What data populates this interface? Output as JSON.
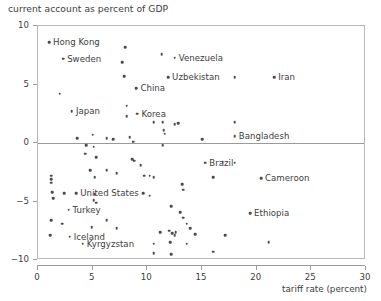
{
  "chart_data": {
    "type": "scatter",
    "title": "current account as percent of GDP",
    "xlabel": "tariff rate (percent)",
    "ylabel": "current account as percent of GDP",
    "xlim": [
      0,
      30
    ],
    "ylim": [
      -10,
      10
    ],
    "xticks": [
      0,
      5,
      10,
      15,
      20,
      25,
      30
    ],
    "yticks": [
      -10,
      -5,
      0,
      5,
      10
    ],
    "xtick_labels": [
      "0",
      "5",
      "10",
      "15",
      "20",
      "25",
      "30"
    ],
    "ytick_labels": [
      "−10",
      "−5",
      "0",
      "5",
      "10"
    ],
    "grid": false,
    "legend": null,
    "reference_lines": [
      {
        "axis": "y",
        "value": 0
      }
    ],
    "marker_color": "#4a4a4a",
    "axis_color": "#9a9a9a",
    "labeled_points": [
      {
        "label": "Hong Kong",
        "x": 1.0,
        "y": 8.6,
        "label_dx": 4
      },
      {
        "label": "Sweden",
        "x": 2.3,
        "y": 7.2,
        "label_dx": 4
      },
      {
        "label": "Venezuela",
        "x": 12.5,
        "y": 7.3,
        "label_dx": 4
      },
      {
        "label": "Uzbekistan",
        "x": 11.9,
        "y": 5.6,
        "label_dx": 4
      },
      {
        "label": "Iran",
        "x": 21.6,
        "y": 5.6,
        "label_dx": 4
      },
      {
        "label": "China",
        "x": 9.0,
        "y": 4.7,
        "label_dx": 4
      },
      {
        "label": "Japan",
        "x": 3.1,
        "y": 2.7,
        "label_dx": 4
      },
      {
        "label": "Korea",
        "x": 9.1,
        "y": 2.5,
        "label_dx": 4
      },
      {
        "label": "Bangladesh",
        "x": 18.0,
        "y": 0.6,
        "label_dx": 4
      },
      {
        "label": "Brazil",
        "x": 15.3,
        "y": -1.7,
        "label_dx": 4
      },
      {
        "label": "Cameroon",
        "x": 20.4,
        "y": -3.0,
        "label_dx": 4
      },
      {
        "label": "United States",
        "x": 3.5,
        "y": -4.3,
        "label_dx": 4
      },
      {
        "label": "Turkey",
        "x": 2.8,
        "y": -5.7,
        "label_dx": 4
      },
      {
        "label": "Ethiopia",
        "x": 19.4,
        "y": -6.0,
        "label_dx": 4
      },
      {
        "label": "Iceland",
        "x": 2.9,
        "y": -8.0,
        "label_dx": 4
      },
      {
        "label": "Kyrgyzstan",
        "x": 4.1,
        "y": -8.6,
        "label_dx": 4
      }
    ],
    "unlabeled_points": [
      {
        "x": 8.0,
        "y": 8.2
      },
      {
        "x": 11.3,
        "y": 7.6
      },
      {
        "x": 7.7,
        "y": 6.9
      },
      {
        "x": 7.9,
        "y": 5.7
      },
      {
        "x": 18.0,
        "y": 5.6
      },
      {
        "x": 2.0,
        "y": 4.2
      },
      {
        "x": 8.1,
        "y": 3.2
      },
      {
        "x": 8.1,
        "y": 2.3
      },
      {
        "x": 10.6,
        "y": 1.8
      },
      {
        "x": 11.4,
        "y": 1.8
      },
      {
        "x": 12.5,
        "y": 1.6
      },
      {
        "x": 12.8,
        "y": 1.7
      },
      {
        "x": 18.0,
        "y": 1.8
      },
      {
        "x": 11.5,
        "y": 1.1
      },
      {
        "x": 11.6,
        "y": 0.8
      },
      {
        "x": 3.6,
        "y": 0.4
      },
      {
        "x": 6.3,
        "y": 0.4
      },
      {
        "x": 5.0,
        "y": 0.7
      },
      {
        "x": 6.9,
        "y": 0.3
      },
      {
        "x": 8.4,
        "y": 0.5
      },
      {
        "x": 8.7,
        "y": 0.1
      },
      {
        "x": 15.0,
        "y": 0.3
      },
      {
        "x": 4.4,
        "y": -0.2
      },
      {
        "x": 5.1,
        "y": -0.3
      },
      {
        "x": 11.4,
        "y": -0.2
      },
      {
        "x": 4.3,
        "y": -0.9
      },
      {
        "x": 5.3,
        "y": -1.2
      },
      {
        "x": 8.6,
        "y": -1.4
      },
      {
        "x": 8.8,
        "y": -1.5
      },
      {
        "x": 9.4,
        "y": -1.9
      },
      {
        "x": 16.9,
        "y": -1.6
      },
      {
        "x": 18.0,
        "y": -1.7
      },
      {
        "x": 4.8,
        "y": -2.3
      },
      {
        "x": 6.3,
        "y": -2.3
      },
      {
        "x": 7.2,
        "y": -2.6
      },
      {
        "x": 1.2,
        "y": -2.8
      },
      {
        "x": 1.2,
        "y": -3.1
      },
      {
        "x": 1.2,
        "y": -3.4
      },
      {
        "x": 5.2,
        "y": -2.9
      },
      {
        "x": 9.7,
        "y": -2.8
      },
      {
        "x": 10.2,
        "y": -2.8
      },
      {
        "x": 10.6,
        "y": -2.9
      },
      {
        "x": 16.0,
        "y": -2.9
      },
      {
        "x": 13.2,
        "y": -3.5
      },
      {
        "x": 13.3,
        "y": -4.0
      },
      {
        "x": 1.3,
        "y": -4.2
      },
      {
        "x": 2.4,
        "y": -4.3
      },
      {
        "x": 1.4,
        "y": -4.7
      },
      {
        "x": 5.2,
        "y": -4.4
      },
      {
        "x": 9.6,
        "y": -4.3
      },
      {
        "x": 10.2,
        "y": -4.5
      },
      {
        "x": 5.1,
        "y": -4.9
      },
      {
        "x": 5.3,
        "y": -5.1
      },
      {
        "x": 12.2,
        "y": -5.4
      },
      {
        "x": 13.0,
        "y": -5.9
      },
      {
        "x": 13.3,
        "y": -6.4
      },
      {
        "x": 1.2,
        "y": -6.6
      },
      {
        "x": 2.2,
        "y": -6.9
      },
      {
        "x": 6.3,
        "y": -6.6
      },
      {
        "x": 13.6,
        "y": -6.9
      },
      {
        "x": 4.9,
        "y": -7.2
      },
      {
        "x": 7.2,
        "y": -7.3
      },
      {
        "x": 13.9,
        "y": -7.3
      },
      {
        "x": 1.1,
        "y": -7.9
      },
      {
        "x": 11.2,
        "y": -7.6
      },
      {
        "x": 12.0,
        "y": -7.5
      },
      {
        "x": 12.3,
        "y": -7.7
      },
      {
        "x": 12.6,
        "y": -7.6
      },
      {
        "x": 12.5,
        "y": -7.9
      },
      {
        "x": 14.4,
        "y": -7.8
      },
      {
        "x": 17.1,
        "y": -7.9
      },
      {
        "x": 10.6,
        "y": -8.6
      },
      {
        "x": 12.1,
        "y": -8.5
      },
      {
        "x": 13.6,
        "y": -8.6
      },
      {
        "x": 21.1,
        "y": -8.5
      },
      {
        "x": 10.6,
        "y": -9.4
      },
      {
        "x": 12.2,
        "y": -9.5
      },
      {
        "x": 16.0,
        "y": -9.3
      }
    ]
  }
}
